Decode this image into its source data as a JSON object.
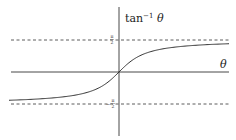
{
  "chart_data": {
    "type": "line",
    "title": "",
    "xlabel": "θ",
    "ylabel": "tan⁻¹ θ",
    "ylabel_parts": {
      "base": "tan",
      "sup": "−1",
      "var": "θ"
    },
    "series": [
      {
        "name": "tan^-1 θ",
        "function": "arctan",
        "x_range": [
          -5.4,
          5.4
        ]
      }
    ],
    "asymptotes": [
      {
        "y": "π/2",
        "style": "dashed"
      },
      {
        "y": "-π/2",
        "style": "dashed"
      }
    ],
    "yticks": [
      {
        "label_num": "π",
        "label_den": "2",
        "sign": ""
      },
      {
        "label_num": "π",
        "label_den": "2",
        "sign": "−"
      }
    ],
    "grid": false,
    "legend": "none"
  }
}
